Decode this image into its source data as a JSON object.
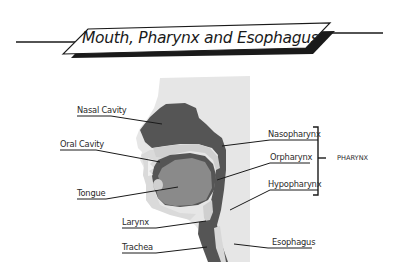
{
  "title": "Mouth, Pharynx and Esophagus",
  "colors": {
    "background": "#ffffff",
    "head_silhouette": "#e6e6e6",
    "face_light": "#dcdcdc",
    "cavity_dark": "#555555",
    "tongue": "#8a8a8a",
    "palate_light": "#cfcfcf",
    "line": "#1a1a1a"
  },
  "labels": {
    "left": [
      {
        "id": "nasal-cavity",
        "text": "Nasal Cavity"
      },
      {
        "id": "oral-cavity",
        "text": "Oral Cavity"
      },
      {
        "id": "tongue",
        "text": "Tongue"
      },
      {
        "id": "larynx",
        "text": "Larynx"
      },
      {
        "id": "trachea",
        "text": "Trachea"
      }
    ],
    "right": [
      {
        "id": "nasopharynx",
        "text": "Nasopharynx"
      },
      {
        "id": "oropharynx",
        "text": "Orpharynx"
      },
      {
        "id": "hypopharynx",
        "text": "Hypopharynx"
      },
      {
        "id": "esophagus",
        "text": "Esophagus"
      }
    ],
    "group": {
      "id": "pharynx",
      "text": "PHARYNX"
    }
  }
}
